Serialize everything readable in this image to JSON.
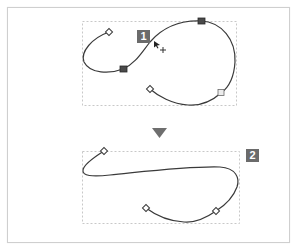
{
  "figure": {
    "steps": [
      {
        "label": "1",
        "description": "original path with selected anchor points (filled squares) and cursor dragging the path"
      },
      {
        "label": "2",
        "description": "reshaped path after edit"
      }
    ],
    "arrow": "down-triangle",
    "colors": {
      "frame": "#cfcfcf",
      "dashed_box": "#c8c8c8",
      "curve": "#3a3a3a",
      "badge_bg": "#6b6b6b",
      "badge_text": "#ffffff",
      "arrow": "#6e6e6e",
      "selected_anchor": "#4a4a4a",
      "unselected_anchor": "#ffffff"
    }
  }
}
